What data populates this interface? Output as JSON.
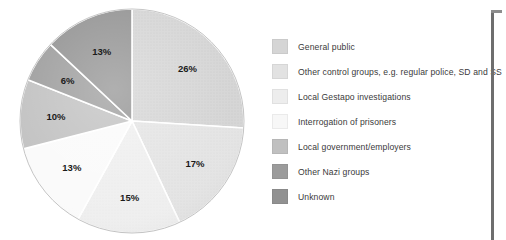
{
  "chart_data": {
    "type": "pie",
    "title": "",
    "subtitle": "",
    "xlabel": "",
    "ylabel": "",
    "grid": false,
    "legend_position": "right",
    "start_angle_deg": 0,
    "direction": "clockwise",
    "unit": "%",
    "categories": [
      "General public",
      "Other control groups, e.g. regular police, SD and SS",
      "Local Gestapo investigations",
      "Interrogation of prisoners",
      "Local government/employers",
      "Other Nazi groups",
      "Unknown"
    ],
    "values": [
      26,
      17,
      15,
      13,
      10,
      6,
      13
    ],
    "labels": [
      "26%",
      "17%",
      "15%",
      "13%",
      "10%",
      "6%",
      "13%"
    ],
    "colors": [
      "#d5d5d5",
      "#e2e2e2",
      "#ededed",
      "#fafafa",
      "#c0c0c0",
      "#9b9b9b",
      "#919191"
    ]
  },
  "legend": {
    "items": [
      {
        "label": "General public",
        "color": "#d5d5d5",
        "swatch_name": "legend-swatch-general-public"
      },
      {
        "label": "Other control groups, e.g. regular police, SD and SS",
        "color": "#e2e2e2",
        "swatch_name": "legend-swatch-other-control-groups"
      },
      {
        "label": "Local Gestapo investigations",
        "color": "#ededed",
        "swatch_name": "legend-swatch-local-gestapo-investigations"
      },
      {
        "label": "Interrogation of prisoners",
        "color": "#f7f7f7",
        "swatch_name": "legend-swatch-interrogation-of-prisoners"
      },
      {
        "label": "Local government/employers",
        "color": "#c0c0c0",
        "swatch_name": "legend-swatch-local-government-employers"
      },
      {
        "label": "Other Nazi groups",
        "color": "#9b9b9b",
        "swatch_name": "legend-swatch-other-nazi-groups"
      },
      {
        "label": "Unknown",
        "color": "#919191",
        "swatch_name": "legend-swatch-unknown"
      }
    ]
  },
  "pie": {
    "center_x": 114,
    "center_y": 113,
    "radius": 112,
    "label_radius_factor": 0.68,
    "separator_color": "#ffffff",
    "separator_width": 1.6,
    "edge_color": "#bdbdbd"
  }
}
